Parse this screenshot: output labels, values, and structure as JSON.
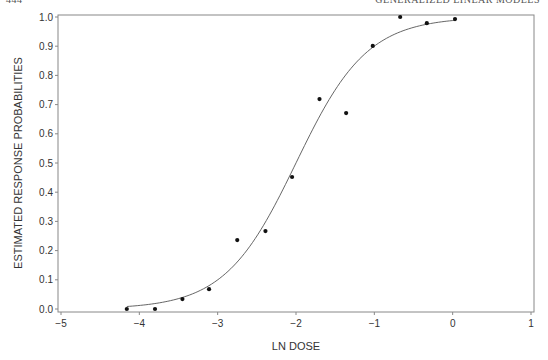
{
  "page_header": {
    "page_number": "444",
    "running_title": "GENERALIZED LINEAR MODELS"
  },
  "chart_data": {
    "type": "scatter",
    "title": "",
    "xlabel": "LN DOSE",
    "ylabel": "ESTIMATED RESPONSE PROBABILITIES",
    "xlim": [
      -5,
      1
    ],
    "ylim": [
      0.0,
      1.0
    ],
    "xticks": [
      -5,
      -4,
      -3,
      -2,
      -1,
      0,
      1
    ],
    "xtick_labels": [
      "−5",
      "−4",
      "−3",
      "−2",
      "−1",
      "0",
      "1"
    ],
    "yticks": [
      0.0,
      0.1,
      0.2,
      0.3,
      0.4,
      0.5,
      0.6,
      0.7,
      0.8,
      0.9,
      1.0
    ],
    "ytick_labels": [
      "0.0",
      "0.1",
      "0.2",
      "0.3",
      "0.4",
      "0.5",
      "0.6",
      "0.7",
      "0.8",
      "0.9",
      "1.0"
    ],
    "grid": false,
    "legend": null,
    "series": [
      {
        "name": "observed proportions",
        "kind": "points",
        "x": [
          -4.16,
          -3.8,
          -3.45,
          -3.11,
          -2.75,
          -2.39,
          -2.05,
          -1.7,
          -1.36,
          -1.02,
          -0.67,
          -0.33,
          0.03
        ],
        "y": [
          0.0,
          0.0,
          0.034,
          0.068,
          0.236,
          0.267,
          0.452,
          0.719,
          0.671,
          0.901,
          1.0,
          0.979,
          0.993
        ]
      },
      {
        "name": "fitted logistic curve",
        "kind": "line",
        "model": "p = 1 / (1 + exp(-2.2 * (x + 2.0)))",
        "x_range": [
          -4.16,
          0.03
        ]
      }
    ]
  }
}
